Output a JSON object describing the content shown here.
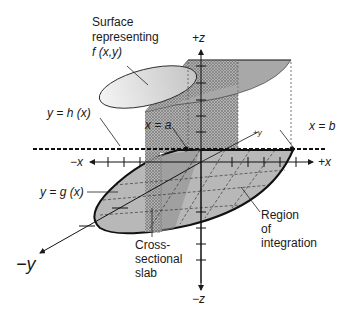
{
  "diagram": {
    "type": "3d-double-integral-illustration",
    "axes": {
      "pos_z": "+z",
      "neg_z": "−z",
      "pos_x": "+x",
      "neg_x": "−x",
      "pos_y": "+y",
      "neg_y": "−y"
    },
    "labels": {
      "surface_line1": "Surface",
      "surface_line2": "representing",
      "surface_line3": "f (x,y)",
      "upper_curve": "y = h (x)",
      "lower_curve": "y = g (x)",
      "left_bound": "x = a",
      "right_bound": "x = b",
      "slab_line1": "Cross-",
      "slab_line2": "sectional",
      "slab_line3": "slab",
      "region_line1": "Region",
      "region_line2": "of",
      "region_line3": "integration"
    },
    "caption": "",
    "colors": {
      "ink": "#1a1a1a",
      "region_fill": "#b8b8b8",
      "slab_fill": "#8c8c8c",
      "surface_light": "#e6e6e6",
      "surface_dark": "#9a9a9a",
      "wall_fill": "#c8c8c8"
    }
  }
}
